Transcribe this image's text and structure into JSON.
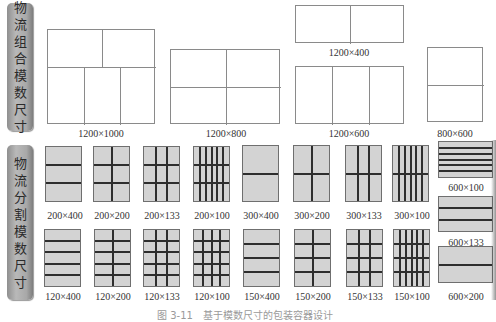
{
  "side_labels": {
    "combination": [
      "物",
      "流",
      "组",
      "合",
      "模",
      "数",
      "尺",
      "寸"
    ],
    "split": [
      "物",
      "流",
      "分",
      "割",
      "模",
      "数",
      "尺",
      "寸"
    ]
  },
  "combination_modules": [
    {
      "label": "1200×1000",
      "x": 47,
      "y": 29,
      "w": 108,
      "h": 95,
      "lbl_x": 101,
      "lbl_y": 128,
      "lines": [
        {
          "t": "h",
          "x": 0,
          "y": 37,
          "len": 108
        },
        {
          "t": "v",
          "x": 54,
          "y": 0,
          "len": 37
        },
        {
          "t": "v",
          "x": 36,
          "y": 37,
          "len": 58
        },
        {
          "t": "v",
          "x": 72,
          "y": 37,
          "len": 58
        }
      ]
    },
    {
      "label": "1200×800",
      "x": 170,
      "y": 49,
      "w": 110,
      "h": 75,
      "lbl_x": 226,
      "lbl_y": 128,
      "lines": [
        {
          "t": "h",
          "x": 0,
          "y": 37,
          "len": 110
        },
        {
          "t": "v",
          "x": 55,
          "y": 0,
          "len": 75
        }
      ]
    },
    {
      "label": "1200×400",
      "x": 295,
      "y": 5,
      "w": 109,
      "h": 38,
      "lbl_x": 349,
      "lbl_y": 47,
      "lines": [
        {
          "t": "v",
          "x": 54,
          "y": 0,
          "len": 38
        }
      ]
    },
    {
      "label": "1200×600",
      "x": 295,
      "y": 66,
      "w": 109,
      "h": 58,
      "lbl_x": 349,
      "lbl_y": 128,
      "lines": [
        {
          "t": "v",
          "x": 36,
          "y": 0,
          "len": 58
        },
        {
          "t": "v",
          "x": 73,
          "y": 0,
          "len": 58
        }
      ]
    },
    {
      "label": "800×600",
      "x": 427,
      "y": 47,
      "w": 56,
      "h": 75,
      "lbl_x": 455,
      "lbl_y": 128,
      "lines": [
        {
          "t": "h",
          "x": 0,
          "y": 37,
          "len": 56
        }
      ]
    }
  ],
  "split_modules_row1": [
    {
      "label": "200×400",
      "x": 45,
      "y": 146,
      "w": 37,
      "h": 56,
      "rows": 3,
      "cols": 1,
      "lbl_x": 65,
      "lbl_y": 210
    },
    {
      "label": "200×200",
      "x": 93,
      "y": 146,
      "w": 37,
      "h": 56,
      "rows": 3,
      "cols": 2,
      "lbl_x": 112,
      "lbl_y": 210
    },
    {
      "label": "200×133",
      "x": 143,
      "y": 146,
      "w": 37,
      "h": 56,
      "rows": 3,
      "cols": 3,
      "lbl_x": 162,
      "lbl_y": 210
    },
    {
      "label": "200×100",
      "x": 193,
      "y": 146,
      "w": 37,
      "h": 56,
      "rows": 3,
      "cols": 6,
      "lbl_x": 212,
      "lbl_y": 210
    },
    {
      "label": "300×400",
      "x": 242,
      "y": 145,
      "w": 37,
      "h": 57,
      "rows": 2,
      "cols": 1,
      "lbl_x": 261,
      "lbl_y": 210
    },
    {
      "label": "300×200",
      "x": 293,
      "y": 145,
      "w": 37,
      "h": 57,
      "rows": 2,
      "cols": 2,
      "lbl_x": 312,
      "lbl_y": 210
    },
    {
      "label": "300×133",
      "x": 345,
      "y": 145,
      "w": 37,
      "h": 57,
      "rows": 2,
      "cols": 3,
      "lbl_x": 364,
      "lbl_y": 210
    },
    {
      "label": "300×100",
      "x": 392,
      "y": 145,
      "w": 37,
      "h": 57,
      "rows": 2,
      "cols": 6,
      "lbl_x": 412,
      "lbl_y": 210
    }
  ],
  "split_modules_row2": [
    {
      "label": "120×400",
      "x": 44,
      "y": 229,
      "w": 37,
      "h": 58,
      "rows": 5,
      "cols": 1,
      "lbl_x": 63,
      "lbl_y": 291
    },
    {
      "label": "120×200",
      "x": 94,
      "y": 229,
      "w": 37,
      "h": 58,
      "rows": 5,
      "cols": 2,
      "lbl_x": 113,
      "lbl_y": 291
    },
    {
      "label": "120×133",
      "x": 143,
      "y": 229,
      "w": 37,
      "h": 58,
      "rows": 5,
      "cols": 3,
      "lbl_x": 162,
      "lbl_y": 291
    },
    {
      "label": "120×100",
      "x": 193,
      "y": 229,
      "w": 37,
      "h": 58,
      "rows": 5,
      "cols": 4,
      "lbl_x": 212,
      "lbl_y": 291
    },
    {
      "label": "150×400",
      "x": 243,
      "y": 229,
      "w": 37,
      "h": 58,
      "rows": 4,
      "cols": 1,
      "lbl_x": 262,
      "lbl_y": 291
    },
    {
      "label": "150×200",
      "x": 294,
      "y": 229,
      "w": 37,
      "h": 58,
      "rows": 4,
      "cols": 2,
      "lbl_x": 313,
      "lbl_y": 291
    },
    {
      "label": "150×133",
      "x": 346,
      "y": 229,
      "w": 37,
      "h": 58,
      "rows": 4,
      "cols": 3,
      "lbl_x": 365,
      "lbl_y": 291
    },
    {
      "label": "150×100",
      "x": 393,
      "y": 229,
      "w": 37,
      "h": 58,
      "rows": 4,
      "cols": 6,
      "lbl_x": 412,
      "lbl_y": 291
    }
  ],
  "split_modules_right": [
    {
      "label": "600×100",
      "x": 438,
      "y": 141,
      "w": 55,
      "h": 37,
      "rows": 6,
      "cols": 1,
      "lbl_x": 466,
      "lbl_y": 182
    },
    {
      "label": "600×133",
      "x": 438,
      "y": 196,
      "w": 55,
      "h": 36,
      "rows": 3,
      "cols": 1,
      "lbl_x": 466,
      "lbl_y": 237
    },
    {
      "label": "600×200",
      "x": 438,
      "y": 246,
      "w": 55,
      "h": 37,
      "rows": 2,
      "cols": 1,
      "lbl_x": 466,
      "lbl_y": 291
    }
  ],
  "caption": "图 3-11　基于模数尺寸的包装容器设计"
}
